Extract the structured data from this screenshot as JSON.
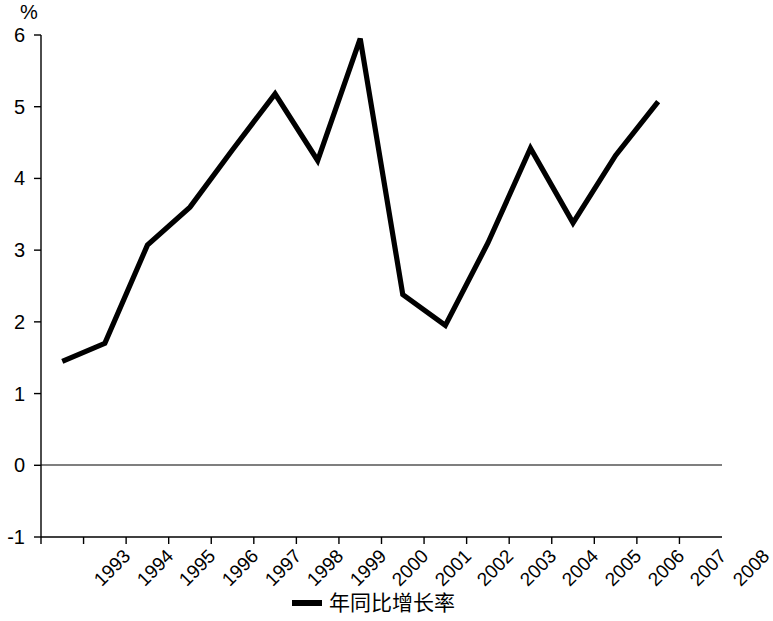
{
  "chart_data": {
    "type": "line",
    "title": "",
    "xlabel": "",
    "ylabel": "%",
    "unit_label": "%",
    "categories": [
      "1993",
      "1994",
      "1995",
      "1996",
      "1997",
      "1998",
      "1999",
      "2000",
      "2001",
      "2002",
      "2003",
      "2004",
      "2005",
      "2006",
      "2007",
      "2008"
    ],
    "x_tick_labels": [
      "1993",
      "1994",
      "1995",
      "1996",
      "1997",
      "1998",
      "1999",
      "2000",
      "2001",
      "2002",
      "2003",
      "2004",
      "2005",
      "2006",
      "2007",
      "2008"
    ],
    "y_tick_labels": [
      "6",
      "5",
      "4",
      "3",
      "2",
      "1",
      "0",
      "-1"
    ],
    "y_ticks": [
      6,
      5,
      4,
      3,
      2,
      1,
      0,
      -1
    ],
    "ylim": [
      -1,
      6
    ],
    "grid": false,
    "legend_position": "bottom-center",
    "line_color": "#000000",
    "axis_color": "#000000",
    "background_color": "#ffffff",
    "series": [
      {
        "name": "年同比增长率",
        "x": [
          "1993",
          "1994",
          "1995",
          "1996",
          "1997",
          "1998",
          "1999",
          "2000",
          "2001",
          "2002",
          "2003",
          "2004",
          "2005",
          "2006",
          "2007"
        ],
        "values": [
          1.45,
          1.7,
          3.07,
          3.6,
          4.4,
          5.18,
          4.25,
          5.95,
          2.38,
          1.95,
          3.1,
          4.42,
          3.38,
          4.32,
          5.07
        ]
      }
    ]
  },
  "legend": {
    "entries": [
      {
        "label": "年同比增长率",
        "color": "#000000"
      }
    ]
  }
}
